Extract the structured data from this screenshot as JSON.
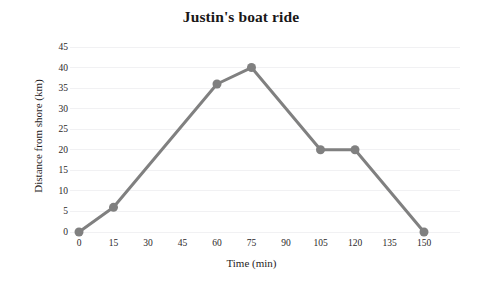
{
  "chart_data": {
    "type": "line",
    "title": "Justin's boat ride",
    "xlabel": "Time (min)",
    "ylabel": "Distance from shore (km)",
    "x": [
      0,
      15,
      60,
      75,
      105,
      120,
      150
    ],
    "values": [
      0,
      6,
      36,
      40,
      20,
      20,
      0
    ],
    "points": [
      {
        "x": 0,
        "y": 0
      },
      {
        "x": 15,
        "y": 6
      },
      {
        "x": 60,
        "y": 36
      },
      {
        "x": 75,
        "y": 40
      },
      {
        "x": 105,
        "y": 20
      },
      {
        "x": 120,
        "y": 20
      },
      {
        "x": 150,
        "y": 0
      }
    ],
    "xlim": [
      0,
      150
    ],
    "ylim": [
      0,
      45
    ],
    "xticks": [
      0,
      15,
      30,
      45,
      60,
      75,
      90,
      105,
      120,
      135,
      150
    ],
    "yticks": [
      0,
      5,
      10,
      15,
      20,
      25,
      30,
      35,
      40,
      45
    ],
    "xtick_labels": [
      "0",
      "15",
      "30",
      "45",
      "60",
      "75",
      "90",
      "105",
      "120",
      "135",
      "150"
    ],
    "ytick_labels": [
      "0",
      "5",
      "10",
      "15",
      "20",
      "25",
      "30",
      "35",
      "40",
      "45"
    ],
    "grid": "horizontal",
    "legend": "none",
    "series_color": "#808080",
    "grid_color": "#f1f1f3",
    "background_color": "#ffffff",
    "marker": "circle",
    "marker_size": 9,
    "line_width": 3
  }
}
